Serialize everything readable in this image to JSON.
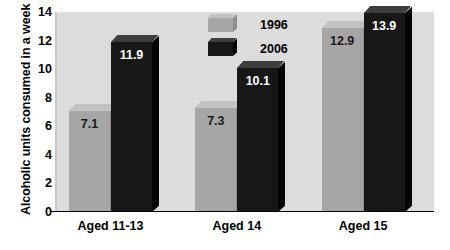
{
  "chart_data": {
    "type": "bar",
    "title": "",
    "xlabel": "",
    "ylabel": "Alcoholic units consumed in a week",
    "categories": [
      "Aged 11-13",
      "Aged 14",
      "Aged 15"
    ],
    "series": [
      {
        "name": "1996",
        "color": "#a6a6a6",
        "values": [
          7.1,
          7.3,
          12.9
        ]
      },
      {
        "name": "2006",
        "color": "#171717",
        "values": [
          11.9,
          10.1,
          13.9
        ]
      }
    ],
    "value_labels": [
      [
        "7.1",
        "7.3",
        "12.9"
      ],
      [
        "11.9",
        "10.1",
        "13.9"
      ]
    ],
    "ylim": [
      0,
      14
    ],
    "yticks": [
      0,
      2,
      4,
      6,
      8,
      10,
      12,
      14
    ],
    "ytick_labels": [
      "0",
      "2",
      "4",
      "6",
      "8",
      "10",
      "12",
      "14"
    ],
    "grid": false,
    "legend_position": "top-center-inside",
    "legend_entries": [
      "1996",
      "2006"
    ],
    "plot_background": "#dcdcdc",
    "figure_background": "#ffffff",
    "style": "3d-bars"
  }
}
